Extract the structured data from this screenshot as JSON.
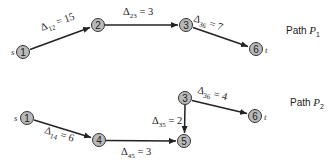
{
  "path1": {
    "label": "Path ",
    "var": "P",
    "sub": "1",
    "source_label": "s",
    "sink_label": "t",
    "nodes": [
      {
        "id": "1",
        "x": 23,
        "y": 52
      },
      {
        "id": "2",
        "x": 98,
        "y": 25
      },
      {
        "id": "3",
        "x": 186,
        "y": 25
      },
      {
        "id": "6",
        "x": 256,
        "y": 49
      }
    ],
    "edges": [
      {
        "from": "1",
        "to": "2",
        "sym": "Δ",
        "sub": "12",
        "value": " = 15"
      },
      {
        "from": "2",
        "to": "3",
        "sym": "Δ",
        "sub": "23",
        "value": " = 3"
      },
      {
        "from": "3",
        "to": "6",
        "sym": "Δ",
        "sub": "36",
        "value": " = 7"
      }
    ]
  },
  "path2": {
    "label": "Path ",
    "var": "P",
    "sub": "2",
    "source_label": "s",
    "sink_label": "t",
    "nodes": [
      {
        "id": "1",
        "x": 27,
        "y": 118
      },
      {
        "id": "4",
        "x": 99,
        "y": 140
      },
      {
        "id": "3",
        "x": 185,
        "y": 98
      },
      {
        "id": "5",
        "x": 184,
        "y": 141
      },
      {
        "id": "6",
        "x": 255,
        "y": 116
      }
    ],
    "edges": [
      {
        "from": "1",
        "to": "4",
        "sym": "Δ",
        "sub": "14",
        "value": " = 6"
      },
      {
        "from": "4",
        "to": "5",
        "sym": "Δ",
        "sub": "45",
        "value": " = 3"
      },
      {
        "from": "3",
        "to": "5",
        "sym": "Δ",
        "sub": "35",
        "value": " = 2"
      },
      {
        "from": "3",
        "to": "6",
        "sym": "Δ",
        "sub": "36",
        "value": " = 4"
      }
    ]
  },
  "colors": {
    "node_fill": "#b9b9b9",
    "node_stroke": "#333333",
    "edge": "#222222",
    "text": "#222222"
  }
}
